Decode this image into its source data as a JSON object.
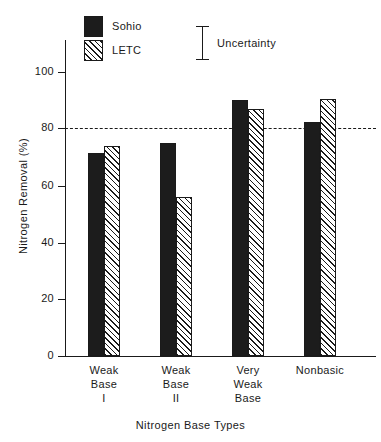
{
  "chart_data": {
    "type": "bar",
    "title": "",
    "xlabel": "Nitrogen Base Types",
    "ylabel": "Nitrogen Removal (%)",
    "categories": [
      "Weak Base I",
      "Weak Base II",
      "Very Weak Base",
      "Nonbasic"
    ],
    "category_lines": [
      [
        "Weak",
        "Base",
        "I"
      ],
      [
        "Weak",
        "Base",
        "II"
      ],
      [
        "Very",
        "Weak",
        "Base"
      ],
      [
        "Nonbasic",
        "",
        ""
      ]
    ],
    "series": [
      {
        "name": "Sohio",
        "values": [
          71.5,
          75,
          90,
          82.5
        ]
      },
      {
        "name": "LETC",
        "values": [
          74,
          56,
          87,
          90.5
        ]
      }
    ],
    "ylim": [
      0,
      110
    ],
    "yticks": [
      0,
      20,
      40,
      60,
      80,
      100
    ],
    "ytick_labels": [
      "0",
      "20",
      "40",
      "60",
      "80",
      "100"
    ],
    "grid": false,
    "reference_line": {
      "value": 80,
      "style": "dashed"
    },
    "legend": {
      "position": "top-left",
      "entries": [
        {
          "label": "Sohio",
          "fill": "solid",
          "color": "#1c1c1c"
        },
        {
          "label": "LETC",
          "fill": "hatched",
          "color": "#1a1a1a"
        }
      ]
    },
    "annotations": [
      {
        "label": "Uncertainty",
        "type": "error-bar-key"
      }
    ]
  }
}
